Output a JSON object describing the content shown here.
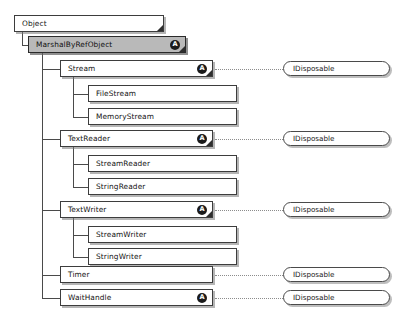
{
  "diagram": {
    "background": "#ffffff",
    "abstract_badge_letter": "A",
    "nodes": [
      {
        "id": "object",
        "label": "Object",
        "x": 14,
        "y": 15,
        "w": 150,
        "abstract": false,
        "selected": false,
        "fold": true
      },
      {
        "id": "marshalbyrefobject",
        "label": "MarshalByRefObject",
        "x": 28,
        "y": 36,
        "w": 158,
        "abstract": true,
        "selected": true,
        "fold": true
      },
      {
        "id": "stream",
        "label": "Stream",
        "x": 60,
        "y": 60,
        "w": 153,
        "abstract": true,
        "selected": false,
        "fold": true
      },
      {
        "id": "filestream",
        "label": "FileStream",
        "x": 88,
        "y": 85,
        "w": 149,
        "abstract": false,
        "selected": false,
        "fold": false
      },
      {
        "id": "memorystream",
        "label": "MemoryStream",
        "x": 88,
        "y": 108,
        "w": 149,
        "abstract": false,
        "selected": false,
        "fold": false
      },
      {
        "id": "textreader",
        "label": "TextReader",
        "x": 60,
        "y": 130,
        "w": 153,
        "abstract": true,
        "selected": false,
        "fold": true
      },
      {
        "id": "streamreader",
        "label": "StreamReader",
        "x": 88,
        "y": 155,
        "w": 149,
        "abstract": false,
        "selected": false,
        "fold": false
      },
      {
        "id": "stringreader",
        "label": "StringReader",
        "x": 88,
        "y": 178,
        "w": 149,
        "abstract": false,
        "selected": false,
        "fold": false
      },
      {
        "id": "textwriter",
        "label": "TextWriter",
        "x": 60,
        "y": 201,
        "w": 153,
        "abstract": true,
        "selected": false,
        "fold": true
      },
      {
        "id": "streamwriter",
        "label": "StreamWriter",
        "x": 88,
        "y": 226,
        "w": 149,
        "abstract": false,
        "selected": false,
        "fold": false
      },
      {
        "id": "stringwriter",
        "label": "StringWriter",
        "x": 88,
        "y": 248,
        "w": 149,
        "abstract": false,
        "selected": false,
        "fold": false
      },
      {
        "id": "timer",
        "label": "Timer",
        "x": 60,
        "y": 266,
        "w": 153,
        "abstract": false,
        "selected": false,
        "fold": false
      },
      {
        "id": "waithandle",
        "label": "WaitHandle",
        "x": 60,
        "y": 289,
        "w": 153,
        "abstract": true,
        "selected": false,
        "fold": false
      }
    ],
    "interfaces": [
      {
        "id": "idisposable-stream",
        "label": "IDisposable",
        "x": 283,
        "y": 61,
        "w": 107
      },
      {
        "id": "idisposable-textreader",
        "label": "IDisposable",
        "x": 283,
        "y": 131,
        "w": 107
      },
      {
        "id": "idisposable-textwriter",
        "label": "IDisposable",
        "x": 283,
        "y": 202,
        "w": 107
      },
      {
        "id": "idisposable-timer",
        "label": "IDisposable",
        "x": 283,
        "y": 267,
        "w": 107
      },
      {
        "id": "idisposable-waithandle",
        "label": "IDisposable",
        "x": 283,
        "y": 290,
        "w": 107
      }
    ],
    "realization_links": [
      {
        "from": "stream",
        "to": "idisposable-stream",
        "x": 215,
        "y": 69,
        "len": 68
      },
      {
        "from": "textreader",
        "to": "idisposable-textreader",
        "x": 215,
        "y": 139,
        "len": 68
      },
      {
        "from": "textwriter",
        "to": "idisposable-textwriter",
        "x": 215,
        "y": 210,
        "len": 68
      },
      {
        "from": "timer",
        "to": "idisposable-timer",
        "x": 215,
        "y": 275,
        "len": 68
      },
      {
        "from": "waithandle",
        "to": "idisposable-waithandle",
        "x": 215,
        "y": 298,
        "len": 68
      }
    ],
    "inheritance_links": [
      {
        "parent": "object",
        "child": "marshalbyrefobject"
      },
      {
        "parent": "marshalbyrefobject",
        "child": "stream"
      },
      {
        "parent": "marshalbyrefobject",
        "child": "textreader"
      },
      {
        "parent": "marshalbyrefobject",
        "child": "textwriter"
      },
      {
        "parent": "marshalbyrefobject",
        "child": "timer"
      },
      {
        "parent": "marshalbyrefobject",
        "child": "waithandle"
      },
      {
        "parent": "stream",
        "child": "filestream"
      },
      {
        "parent": "stream",
        "child": "memorystream"
      },
      {
        "parent": "textreader",
        "child": "streamreader"
      },
      {
        "parent": "textreader",
        "child": "stringreader"
      },
      {
        "parent": "textwriter",
        "child": "streamwriter"
      },
      {
        "parent": "textwriter",
        "child": "stringwriter"
      }
    ],
    "trunks": [
      {
        "id": "trunk-object",
        "x": 22,
        "y": 32,
        "h": 13
      },
      {
        "id": "trunk-marshal",
        "x": 42,
        "y": 53,
        "h": 245
      },
      {
        "id": "trunk-stream",
        "x": 73,
        "y": 77,
        "h": 40
      },
      {
        "id": "trunk-textreader",
        "x": 73,
        "y": 147,
        "h": 40
      },
      {
        "id": "trunk-textwriter",
        "x": 73,
        "y": 218,
        "h": 39
      }
    ],
    "stubs": [
      {
        "id": "stub-marshal",
        "x": 22,
        "y": 45,
        "w": 6
      },
      {
        "id": "stub-stream",
        "x": 42,
        "y": 69,
        "w": 18
      },
      {
        "id": "stub-filestream",
        "x": 73,
        "y": 94,
        "w": 15
      },
      {
        "id": "stub-memorystream",
        "x": 73,
        "y": 117,
        "w": 15
      },
      {
        "id": "stub-textreader",
        "x": 42,
        "y": 139,
        "w": 18
      },
      {
        "id": "stub-streamreader",
        "x": 73,
        "y": 164,
        "w": 15
      },
      {
        "id": "stub-stringreader",
        "x": 73,
        "y": 187,
        "w": 15
      },
      {
        "id": "stub-textwriter",
        "x": 42,
        "y": 210,
        "w": 18
      },
      {
        "id": "stub-streamwriter",
        "x": 73,
        "y": 235,
        "w": 15
      },
      {
        "id": "stub-stringwriter",
        "x": 73,
        "y": 257,
        "w": 15
      },
      {
        "id": "stub-timer",
        "x": 42,
        "y": 275,
        "w": 18
      },
      {
        "id": "stub-waithandle",
        "x": 42,
        "y": 298,
        "w": 18
      }
    ]
  }
}
